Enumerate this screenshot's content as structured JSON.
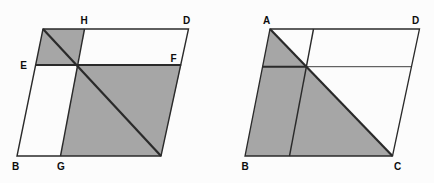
{
  "canvas": {
    "width": 434,
    "height": 183,
    "background": "#fcfcfc"
  },
  "style": {
    "shade_fill": "#a6a6a6",
    "line_color": "#2a2a2a",
    "label_color": "#0d0d0d",
    "label_font_size": 10
  },
  "figures": [
    {
      "id": "left-parallelogram-figure",
      "shaded": [
        {
          "name": "shaded-parallelogram-top-left",
          "points": "43,29 84.5,29 77.3,65 35.6,65"
        },
        {
          "name": "shaded-parallelogram-bottom-right",
          "points": "77.3,65 181.2,65 161,156 60.5,156"
        }
      ],
      "outlines": [
        {
          "name": "parallelogram-outline",
          "points": "43,29 188.5,29 161,156 17,156",
          "width": 1.4
        }
      ],
      "lines": [
        {
          "name": "segment-EF",
          "x1": 35.6,
          "y1": 65,
          "x2": 181.2,
          "y2": 65,
          "width": 1.9
        },
        {
          "name": "segment-HG",
          "x1": 84.5,
          "y1": 29,
          "x2": 60.5,
          "y2": 156,
          "width": 1.4
        },
        {
          "name": "diagonal-segment",
          "x1": 43,
          "y1": 29,
          "x2": 161,
          "y2": 156,
          "width": 2.2
        }
      ],
      "labels": [
        {
          "text": "H",
          "x": 84,
          "y": 24
        },
        {
          "text": "D",
          "x": 186.5,
          "y": 24
        },
        {
          "text": "E",
          "x": 23.5,
          "y": 68.5
        },
        {
          "text": "F",
          "x": 173.5,
          "y": 61.5
        },
        {
          "text": "B",
          "x": 15.5,
          "y": 170
        },
        {
          "text": "G",
          "x": 61,
          "y": 170
        }
      ]
    },
    {
      "id": "right-parallelogram-figure",
      "shaded": [
        {
          "name": "shaded-triangle-ABC",
          "points": "270,29 245,156 392.5,156"
        }
      ],
      "outlines": [
        {
          "name": "parallelogram-outline",
          "points": "270,29 419.5,29 392.5,156 245,156",
          "width": 1.3
        }
      ],
      "lines": [
        {
          "name": "transversal-parallel-to-sides",
          "x1": 313.5,
          "y1": 29,
          "x2": 289.5,
          "y2": 156,
          "width": 1.4
        },
        {
          "name": "transversal-horizontal-bold",
          "x1": 262.3,
          "y1": 66.7,
          "x2": 306.4,
          "y2": 66.7,
          "width": 1.9
        },
        {
          "name": "transversal-horizontal-thin",
          "x1": 306.4,
          "y1": 66.7,
          "x2": 411.5,
          "y2": 66.7,
          "width": 0.9
        },
        {
          "name": "diagonal-AC",
          "x1": 270,
          "y1": 29,
          "x2": 392.5,
          "y2": 156,
          "width": 2.2
        }
      ],
      "labels": [
        {
          "text": "A",
          "x": 266.5,
          "y": 24
        },
        {
          "text": "D",
          "x": 415.5,
          "y": 24
        },
        {
          "text": "B",
          "x": 245,
          "y": 170
        },
        {
          "text": "C",
          "x": 397.5,
          "y": 170
        }
      ]
    }
  ]
}
